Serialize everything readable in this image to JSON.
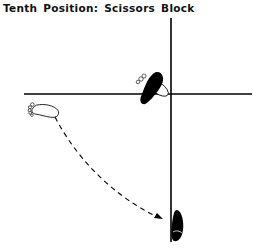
{
  "title": "Tenth Position: Scissors Block",
  "diagram": {
    "vertical_line": {
      "x": 171,
      "y1": 18,
      "y2": 242
    },
    "horizontal_line": {
      "y": 94,
      "x1": 24,
      "x2": 252
    },
    "footprints": [
      {
        "name": "start-foot-outline",
        "style": "outline",
        "position": "left of horizontal line"
      },
      {
        "name": "planted-foot-solid",
        "style": "solid",
        "position": "upper-left of intersection"
      },
      {
        "name": "pivot-foot-outline",
        "style": "outline",
        "position": "at intersection"
      },
      {
        "name": "end-foot-solid",
        "style": "solid",
        "position": "lower vertical line"
      }
    ],
    "path": {
      "style": "dashed",
      "arrowhead": true,
      "from": "start-foot",
      "to": "end-foot"
    },
    "colors": {
      "ink": "#000000",
      "background": "#ffffff"
    }
  }
}
